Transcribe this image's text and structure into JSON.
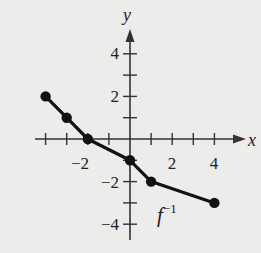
{
  "chart_data": {
    "type": "line",
    "title": "",
    "xlabel": "x",
    "ylabel": "y",
    "xlim": [
      -5,
      5
    ],
    "ylim": [
      -5,
      5
    ],
    "x_ticks": [
      -4,
      -3,
      -2,
      -1,
      0,
      1,
      2,
      3,
      4
    ],
    "y_ticks": [
      -4,
      -3,
      -2,
      -1,
      0,
      1,
      2,
      3,
      4
    ],
    "x_tick_labels": [
      "-2",
      "2",
      "4"
    ],
    "x_tick_label_values": [
      -2,
      2,
      4
    ],
    "y_tick_labels": [
      "4",
      "2",
      "-2",
      "-4"
    ],
    "y_tick_label_values": [
      4,
      2,
      -2,
      -4
    ],
    "grid": false,
    "series": [
      {
        "name": "f^-1",
        "label": "f",
        "label_superscript": "−1",
        "x": [
          -4,
          -3,
          -2,
          0,
          1,
          4
        ],
        "y": [
          2,
          1,
          0,
          -1,
          -2,
          -3
        ],
        "markers": true,
        "color": "#111111"
      }
    ]
  },
  "labels": {
    "x_axis": "x",
    "y_axis": "y",
    "curve_name": "f",
    "curve_sup": "−1",
    "tick_x_neg2": "−2",
    "tick_x_2": "2",
    "tick_x_4": "4",
    "tick_y_4": "4",
    "tick_y_2": "2",
    "tick_y_neg2": "−2",
    "tick_y_neg4": "−4"
  }
}
